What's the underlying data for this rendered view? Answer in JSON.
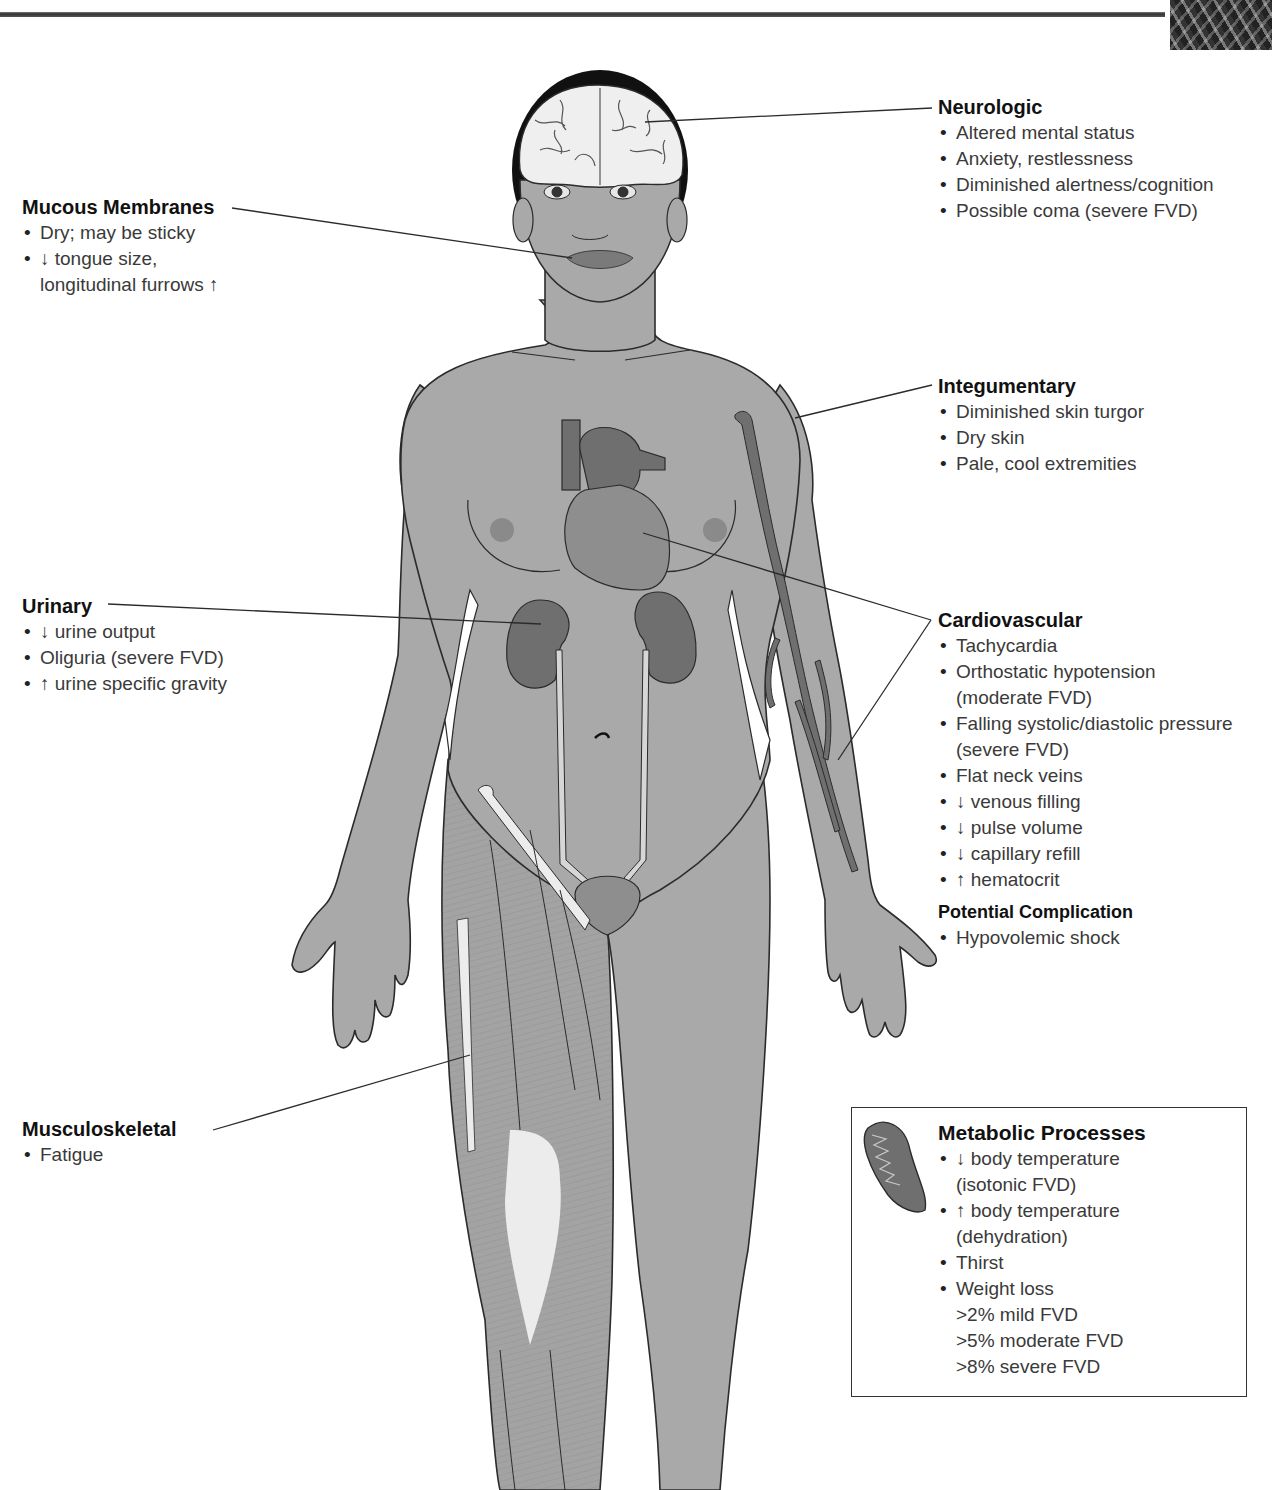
{
  "colors": {
    "body_fill": "#a9a9a9",
    "organ_fill": "#6f6f6f",
    "organ_light": "#8e8e8e",
    "outline": "#2b2b2b",
    "bone_fill": "#ececec",
    "hair": "#111111"
  },
  "sections": {
    "neurologic": {
      "title": "Neurologic",
      "items": [
        "Altered mental status",
        "Anxiety, restlessness",
        "Diminished alertness/cognition",
        "Possible coma (severe FVD)"
      ]
    },
    "mucous_membranes": {
      "title": "Mucous Membranes",
      "items": [
        "Dry; may be sticky",
        "↓ tongue size,",
        "longitudinal furrows ↑"
      ]
    },
    "integumentary": {
      "title": "Integumentary",
      "items": [
        "Diminished skin turgor",
        "Dry skin",
        "Pale, cool extremities"
      ]
    },
    "urinary": {
      "title": "Urinary",
      "items": [
        "↓ urine output",
        "Oliguria (severe FVD)",
        "↑ urine specific gravity"
      ]
    },
    "cardiovascular": {
      "title": "Cardiovascular",
      "items": [
        "Tachycardia",
        "Orthostatic hypotension",
        "(moderate FVD)",
        "Falling systolic/diastolic pressure",
        "(severe FVD)",
        "Flat neck veins",
        "↓ venous filling",
        "↓ pulse volume",
        "↓ capillary refill",
        "↑ hematocrit"
      ]
    },
    "potential_complication": {
      "title": "Potential Complication",
      "items": [
        "Hypovolemic shock"
      ]
    },
    "musculoskeletal": {
      "title": "Musculoskeletal",
      "items": [
        "Fatigue"
      ]
    },
    "metabolic": {
      "title": "Metabolic Processes",
      "items": [
        "↓ body temperature",
        "(isotonic FVD)",
        "↑ body temperature",
        "(dehydration)",
        "Thirst",
        "Weight loss"
      ],
      "sub_items": [
        ">2% mild FVD",
        ">5% moderate FVD",
        ">8% severe FVD"
      ]
    }
  },
  "icons": {
    "brain": "brain-illustration",
    "heart": "heart-illustration",
    "kidneys": "kidney-illustration",
    "bladder": "bladder-illustration",
    "veins": "arm-veins-illustration",
    "muscles": "leg-muscles-illustration",
    "mitochondrion": "mitochondrion-icon"
  }
}
